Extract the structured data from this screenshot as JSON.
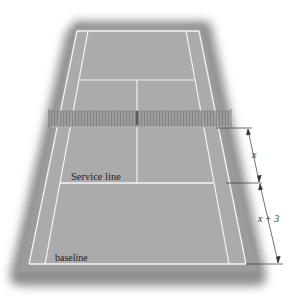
{
  "figure": {
    "type": "tennis-court-perspective",
    "labels": {
      "service_line": "Service line",
      "baseline": "baseline"
    },
    "dimensions": {
      "upper_segment": "x",
      "lower_segment": "x + 3"
    },
    "colors": {
      "background": "#ffffff",
      "surround": "#8c8c8c",
      "surround_edge": "#b5b5b5",
      "court": "#a9a9a9",
      "lines": "#f4f4f4",
      "net": "#8a8a8a",
      "dimension_line": "#333333",
      "text": "#222222"
    }
  }
}
